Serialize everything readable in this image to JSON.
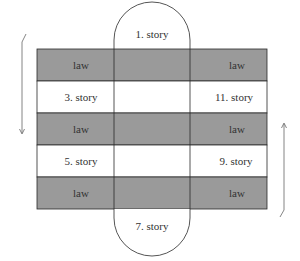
{
  "diagram": {
    "type": "alternating-rows-with-central-arches",
    "colors": {
      "law_row_fill": "#9a9a9a",
      "story_row_fill": "#ffffff",
      "border": "#2a2a2a",
      "arrow": "#666666",
      "text": "#333333"
    },
    "top_arch": {
      "label": "1. story"
    },
    "bottom_arch": {
      "label": "7. story"
    },
    "rows": [
      {
        "kind": "law",
        "left": "law",
        "right": "law"
      },
      {
        "kind": "story",
        "left": "3. story",
        "right": "11. story"
      },
      {
        "kind": "law",
        "left": "law",
        "right": "law"
      },
      {
        "kind": "story",
        "left": "5. story",
        "right": "9. story"
      },
      {
        "kind": "law",
        "left": "law",
        "right": "law"
      }
    ],
    "arrows": {
      "left": {
        "direction": "down"
      },
      "right": {
        "direction": "up"
      }
    }
  }
}
